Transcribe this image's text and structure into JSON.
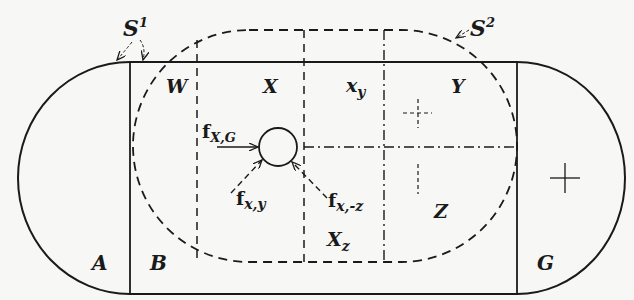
{
  "diagram": {
    "type": "field-topology",
    "outer_region": {
      "shape": "stadium",
      "line_style": "solid",
      "regions": [
        {
          "id": "A",
          "label": "A"
        },
        {
          "id": "B",
          "label": "B"
        },
        {
          "id": "G",
          "label": "G"
        }
      ]
    },
    "boundaries": [
      {
        "id": "S1",
        "label": "S",
        "superscript": "1",
        "line_style": "solid"
      },
      {
        "id": "S2",
        "label": "S",
        "superscript": "2",
        "line_style": "dashed"
      }
    ],
    "inner_regions": [
      {
        "id": "W",
        "label": "W"
      },
      {
        "id": "X",
        "label": "X"
      },
      {
        "id": "xy",
        "label": "x",
        "subscript": "y"
      },
      {
        "id": "Y",
        "label": "Y"
      },
      {
        "id": "Xz",
        "label": "X",
        "subscript": "z"
      },
      {
        "id": "Z",
        "label": "Z"
      }
    ],
    "forces": [
      {
        "id": "fXG",
        "label": "f",
        "subscript": "X,G",
        "line_style": "solid"
      },
      {
        "id": "fxy",
        "label": "f",
        "subscript": "x,y",
        "line_style": "dashed"
      },
      {
        "id": "fxz",
        "label": "f",
        "subscript": "x,-z",
        "line_style": "dashed"
      }
    ],
    "markers": [
      {
        "id": "plus-dashed",
        "symbol": "+",
        "region": "Y",
        "line_style": "dashed"
      },
      {
        "id": "plus-solid",
        "symbol": "+",
        "region": "G",
        "line_style": "solid"
      }
    ],
    "center_object": {
      "shape": "circle",
      "label": "person"
    },
    "colors": {
      "ink": "#1a1a1a",
      "paper": "#f7f7f5"
    }
  }
}
